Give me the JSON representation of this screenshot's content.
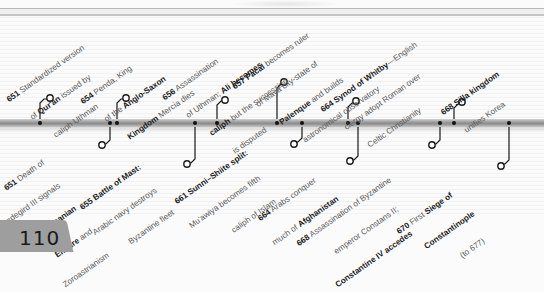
{
  "page": {
    "number": "110"
  },
  "timeline": {
    "events_above": [
      {
        "year": "651",
        "lines": [
          [
            "",
            "Standardized version"
          ],
          [
            "of ",
            "Qur'an",
            " issued by"
          ],
          [
            "caliph Uthman"
          ]
        ],
        "tick_x": 40
      },
      {
        "year": "654",
        "lines": [
          [
            "",
            "Penda, King"
          ],
          [
            "of the ",
            "Anglo-Saxon"
          ],
          [
            "",
            "Kingdom",
            " Mercia dies"
          ]
        ],
        "tick_x": 117
      },
      {
        "year": "656",
        "lines": [
          [
            "",
            "Assassination"
          ],
          [
            "of Uthman; ",
            "Ali becomes"
          ],
          [
            "",
            "caliph",
            " but the succession"
          ],
          [
            "is disputed"
          ]
        ],
        "tick_x": 217
      },
      {
        "year": "657",
        "lines": [
          [
            "",
            "Pacal",
            " becomes ruler"
          ],
          [
            "of Maya city-state of"
          ],
          [
            "",
            "Palenque",
            " and builds"
          ],
          [
            "astronomical observatory"
          ]
        ],
        "tick_x": 276
      },
      {
        "year": "664",
        "lines": [
          [
            "",
            "Synod of Whitby",
            "—English"
          ],
          [
            "clergy adopt Roman over"
          ],
          [
            "Celtic Christianity"
          ]
        ],
        "tick_x": 348
      },
      {
        "year": "668",
        "lines": [
          [
            "",
            "Silla kingdom"
          ],
          [
            "unifies Korea"
          ]
        ],
        "tick_x": 454
      }
    ],
    "events_below": [
      {
        "year": "651",
        "text": "Death of Yazdegird III signals end of Sasanian Empire and Zoroastrianism",
        "tick_x": 110
      },
      {
        "year": "655",
        "text": "Battle of Mast: Arabic navy destroys Byzantine fleet",
        "tick_x": 195
      },
      {
        "year": "661",
        "text": "Sunni–Shiite split: Mu'awiya becomes fifth caliph of Islam",
        "tick_x": 302
      },
      {
        "year": "664",
        "text": "Arabs conquer much of Afghanistan",
        "tick_x": 358
      },
      {
        "year": "668",
        "text": "Assassination of Byzantine emperor Constans II; Constantine IV accedes",
        "tick_x": 440
      },
      {
        "year": "670",
        "text": "First Siege of Constantinople (to 677)",
        "tick_x": 509
      }
    ]
  },
  "labels": {
    "a651": {
      "y": "651",
      "t1": " Standardized version",
      "t2a": "of ",
      "t2b": "Qur'an",
      "t2c": " issued by",
      "t3": "caliph Uthman"
    },
    "a654": {
      "y": "654",
      "t1": " Penda, King",
      "t2a": "of the ",
      "t2b": "Anglo-Saxon",
      "t3a": "Kingdom",
      "t3b": " Mercia dies"
    },
    "a656": {
      "y": "656",
      "t1": " Assassination",
      "t2a": "of Uthman; ",
      "t2b": "Ali becomes",
      "t3a": "caliph",
      "t3b": " but the succession",
      "t4": "is disputed"
    },
    "a657": {
      "y": "657",
      "t1a": " ",
      "t1b": "Pacal",
      "t1c": " becomes ruler",
      "t2": "of Maya city-state of",
      "t3a": "Palenque",
      "t3b": " and builds",
      "t4": "astronomical observatory"
    },
    "a664": {
      "y": "664",
      "t1b": " Synod of Whitby",
      "t1c": "—English",
      "t2": "clergy adopt Roman over",
      "t3": "Celtic Christianity"
    },
    "a668": {
      "y": "668",
      "t1b": " Silla kingdom",
      "t2": "unifies Korea"
    },
    "b651": {
      "y": "651",
      "t1": " Death of",
      "t2": "Yazdegird III signals",
      "t3": "end of Sasanian",
      "t4a": "Empire",
      "t4b": " and",
      "t5": "Zoroastrianism"
    },
    "b655": {
      "y": "655",
      "t1b": " Battle of Mast:",
      "t2": "Arabic navy destroys",
      "t3": "Byzantine fleet"
    },
    "b661": {
      "y": "661",
      "t1b": " Sunni–Shiite split:",
      "t2": "Mu'awiya becomes fifth",
      "t3": "caliph of Islam"
    },
    "b664": {
      "y": "664",
      "t1": " Arabs conquer",
      "t2a": "much of ",
      "t2b": "Afghanistan"
    },
    "b668": {
      "y": "668",
      "t1": " Assassination of Byzantine",
      "t2": "emperor Constans II;",
      "t3": "Constantine IV accedes"
    },
    "b670": {
      "y": "670",
      "t1a": " First ",
      "t1b": "Siege of",
      "t2": "Constantinople",
      "t3": "(to 677)"
    }
  },
  "colors": {
    "bar": "#8c8c8c",
    "text_body": "#5c5c5c",
    "text_bold": "#1c1c1c",
    "page_tab": "#9e9e9e"
  }
}
